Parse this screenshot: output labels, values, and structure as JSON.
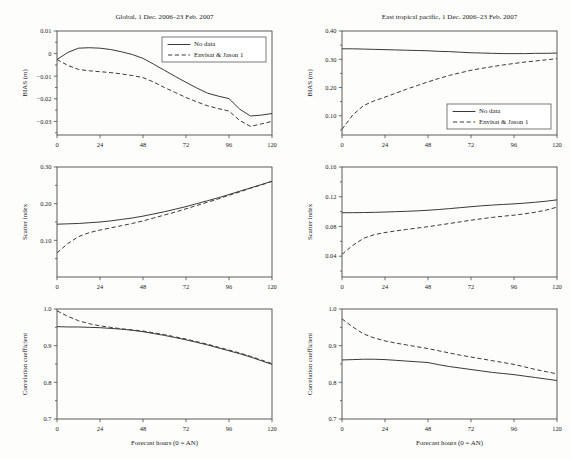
{
  "figure": {
    "name": "forecast-verification-multipanel",
    "width": 571,
    "height": 459,
    "background": "#fdfdfc",
    "line_color": "#3a3a3a",
    "axis_color": "#4a4a4a"
  },
  "legend": {
    "entries": [
      {
        "label": "No data",
        "style": "solid"
      },
      {
        "label": "Envisat & Jason 1",
        "style": "dashed"
      }
    ]
  },
  "axis_titles": {
    "x": "Forecast hours (0 = AN)",
    "bias": "BIAS (m)",
    "scatter": "Scatter index",
    "correlation": "Correlation coefficient"
  },
  "chart_data": [
    {
      "id": "global-bias",
      "type": "line",
      "title": "Global, 1 Dec. 2006–23 Feb. 2007",
      "xlabel": "",
      "ylabel": "BIAS (m)",
      "xlim": [
        0,
        120
      ],
      "ylim": [
        -0.036,
        0.01
      ],
      "xticks": [
        0,
        24,
        48,
        72,
        96,
        120
      ],
      "xticklabels": [
        "0",
        "24",
        "48",
        "72",
        "96",
        "120"
      ],
      "yticks": [
        0.01,
        0,
        -0.01,
        -0.02,
        -0.03
      ],
      "yticklabels": [
        "0.01",
        "0",
        "−0.01",
        "−0.02",
        "−0.03"
      ],
      "grid": false,
      "legend_position": "top-right",
      "x": [
        0,
        6,
        12,
        18,
        24,
        30,
        36,
        42,
        48,
        54,
        60,
        66,
        72,
        78,
        84,
        90,
        96,
        102,
        108,
        114,
        120
      ],
      "series": [
        {
          "name": "No data",
          "style": "solid",
          "values": [
            -0.0026,
            0.0005,
            0.0024,
            0.0026,
            0.0024,
            0.0018,
            0.0008,
            -0.0004,
            -0.0021,
            -0.0047,
            -0.0074,
            -0.0101,
            -0.0127,
            -0.0152,
            -0.0175,
            -0.0188,
            -0.0199,
            -0.0246,
            -0.0276,
            -0.0272,
            -0.0265
          ]
        },
        {
          "name": "Envisat & Jason 1",
          "style": "dashed",
          "values": [
            -0.0026,
            -0.0052,
            -0.007,
            -0.0076,
            -0.008,
            -0.0084,
            -0.009,
            -0.0097,
            -0.0106,
            -0.0126,
            -0.015,
            -0.0172,
            -0.0194,
            -0.0213,
            -0.0231,
            -0.0243,
            -0.0254,
            -0.0296,
            -0.0322,
            -0.0311,
            -0.03
          ]
        }
      ]
    },
    {
      "id": "etp-bias",
      "type": "line",
      "title": "East tropical pacific, 1 Dec. 2006–23 Feb. 2007",
      "xlabel": "",
      "ylabel": "BIAS (m)",
      "xlim": [
        0,
        120
      ],
      "ylim": [
        0.032,
        0.4
      ],
      "xticks": [
        0,
        24,
        48,
        72,
        96,
        120
      ],
      "xticklabels": [
        "0",
        "24",
        "48",
        "72",
        "96",
        "120"
      ],
      "yticks": [
        0.4,
        0.3,
        0.2,
        0.1
      ],
      "yticklabels": [
        "0.40",
        "0.30",
        "0.20",
        "0.10"
      ],
      "grid": false,
      "legend_position": "bottom-right",
      "x": [
        0,
        6,
        12,
        18,
        24,
        30,
        36,
        42,
        48,
        54,
        60,
        66,
        72,
        78,
        84,
        90,
        96,
        102,
        108,
        114,
        120
      ],
      "series": [
        {
          "name": "No data",
          "style": "solid",
          "values": [
            0.337,
            0.337,
            0.336,
            0.335,
            0.334,
            0.333,
            0.332,
            0.331,
            0.33,
            0.328,
            0.327,
            0.325,
            0.323,
            0.322,
            0.321,
            0.32,
            0.32,
            0.32,
            0.321,
            0.321,
            0.322
          ]
        },
        {
          "name": "Envisat & Jason 1",
          "style": "dashed",
          "values": [
            0.052,
            0.103,
            0.136,
            0.153,
            0.166,
            0.18,
            0.194,
            0.207,
            0.22,
            0.232,
            0.243,
            0.252,
            0.261,
            0.268,
            0.274,
            0.28,
            0.285,
            0.29,
            0.294,
            0.298,
            0.302
          ]
        }
      ]
    },
    {
      "id": "global-scatter",
      "type": "line",
      "title": "",
      "xlabel": "",
      "ylabel": "Scatter index",
      "xlim": [
        0,
        120
      ],
      "ylim": [
        0.0,
        0.3
      ],
      "xticks": [
        0,
        24,
        48,
        72,
        96,
        120
      ],
      "xticklabels": [
        "0",
        "24",
        "48",
        "72",
        "96",
        "120"
      ],
      "yticks": [
        0.3,
        0.2,
        0.1
      ],
      "yticklabels": [
        "0.30",
        "0.20",
        "0.10"
      ],
      "grid": false,
      "legend_position": "none",
      "x": [
        0,
        6,
        12,
        18,
        24,
        30,
        36,
        42,
        48,
        54,
        60,
        66,
        72,
        78,
        84,
        90,
        96,
        102,
        108,
        114,
        120
      ],
      "series": [
        {
          "name": "No data",
          "style": "solid",
          "values": [
            0.144,
            0.145,
            0.146,
            0.148,
            0.15,
            0.153,
            0.157,
            0.161,
            0.166,
            0.172,
            0.178,
            0.185,
            0.192,
            0.2,
            0.208,
            0.216,
            0.225,
            0.234,
            0.243,
            0.252,
            0.261
          ]
        },
        {
          "name": "Envisat & Jason 1",
          "style": "dashed",
          "values": [
            0.066,
            0.091,
            0.11,
            0.121,
            0.128,
            0.134,
            0.14,
            0.146,
            0.153,
            0.161,
            0.169,
            0.177,
            0.186,
            0.195,
            0.204,
            0.213,
            0.223,
            0.232,
            0.242,
            0.251,
            0.261
          ]
        }
      ]
    },
    {
      "id": "etp-scatter",
      "type": "line",
      "title": "",
      "xlabel": "",
      "ylabel": "Scatter index",
      "xlim": [
        0,
        120
      ],
      "ylim": [
        0.012,
        0.16
      ],
      "xticks": [
        0,
        24,
        48,
        72,
        96,
        120
      ],
      "xticklabels": [
        "0",
        "24",
        "48",
        "72",
        "96",
        "120"
      ],
      "yticks": [
        0.16,
        0.12,
        0.08,
        0.04
      ],
      "yticklabels": [
        "0.16",
        "0.12",
        "0.08",
        "0.04"
      ],
      "grid": false,
      "legend_position": "none",
      "x": [
        0,
        6,
        12,
        18,
        24,
        30,
        36,
        42,
        48,
        54,
        60,
        66,
        72,
        78,
        84,
        90,
        96,
        102,
        108,
        114,
        120
      ],
      "series": [
        {
          "name": "No data",
          "style": "solid",
          "values": [
            0.0985,
            0.0985,
            0.0987,
            0.099,
            0.0994,
            0.0999,
            0.1004,
            0.101,
            0.1018,
            0.1028,
            0.104,
            0.1053,
            0.1066,
            0.1078,
            0.1088,
            0.1096,
            0.1104,
            0.1114,
            0.1126,
            0.114,
            0.1158
          ]
        },
        {
          "name": "Envisat & Jason 1",
          "style": "dashed",
          "values": [
            0.0425,
            0.0545,
            0.064,
            0.069,
            0.0718,
            0.074,
            0.076,
            0.0778,
            0.0797,
            0.0818,
            0.084,
            0.0862,
            0.0884,
            0.0904,
            0.0922,
            0.0938,
            0.0952,
            0.097,
            0.0992,
            0.102,
            0.106
          ]
        }
      ]
    },
    {
      "id": "global-correlation",
      "type": "line",
      "title": "",
      "xlabel": "Forecast hours (0 = AN)",
      "ylabel": "Correlation coefficient",
      "xlim": [
        0,
        120
      ],
      "ylim": [
        0.7,
        1.0
      ],
      "xticks": [
        0,
        24,
        48,
        72,
        96,
        120
      ],
      "xticklabels": [
        "0",
        "24",
        "48",
        "72",
        "96",
        "120"
      ],
      "yticks": [
        1.0,
        0.9,
        0.8,
        0.7
      ],
      "yticklabels": [
        "1.0",
        "0.9",
        "0.8",
        "0.7"
      ],
      "grid": false,
      "legend_position": "none",
      "x": [
        0,
        6,
        12,
        18,
        24,
        30,
        36,
        42,
        48,
        54,
        60,
        66,
        72,
        78,
        84,
        90,
        96,
        102,
        108,
        114,
        120
      ],
      "series": [
        {
          "name": "No data",
          "style": "solid",
          "values": [
            0.952,
            0.951,
            0.951,
            0.95,
            0.949,
            0.947,
            0.945,
            0.942,
            0.938,
            0.933,
            0.928,
            0.922,
            0.916,
            0.909,
            0.902,
            0.894,
            0.886,
            0.878,
            0.869,
            0.859,
            0.849
          ]
        },
        {
          "name": "Envisat & Jason 1",
          "style": "dashed",
          "values": [
            0.995,
            0.98,
            0.968,
            0.96,
            0.954,
            0.95,
            0.946,
            0.943,
            0.94,
            0.935,
            0.93,
            0.924,
            0.918,
            0.911,
            0.904,
            0.896,
            0.888,
            0.88,
            0.871,
            0.861,
            0.851
          ]
        }
      ]
    },
    {
      "id": "etp-correlation",
      "type": "line",
      "title": "",
      "xlabel": "Forecast hours (0 = AN)",
      "ylabel": "Correlation coefficient",
      "xlim": [
        0,
        120
      ],
      "ylim": [
        0.7,
        1.0
      ],
      "xticks": [
        0,
        24,
        48,
        72,
        96,
        120
      ],
      "xticklabels": [
        "0",
        "24",
        "48",
        "72",
        "96",
        "120"
      ],
      "yticks": [
        1.0,
        0.9,
        0.8,
        0.7
      ],
      "yticklabels": [
        "1.0",
        "0.9",
        "0.8",
        "0.7"
      ],
      "grid": false,
      "legend_position": "none",
      "x": [
        0,
        6,
        12,
        18,
        24,
        30,
        36,
        42,
        48,
        54,
        60,
        66,
        72,
        78,
        84,
        90,
        96,
        102,
        108,
        114,
        120
      ],
      "series": [
        {
          "name": "No data",
          "style": "solid",
          "values": [
            0.861,
            0.862,
            0.863,
            0.863,
            0.862,
            0.86,
            0.858,
            0.856,
            0.854,
            0.848,
            0.843,
            0.839,
            0.835,
            0.831,
            0.827,
            0.824,
            0.821,
            0.817,
            0.813,
            0.809,
            0.805
          ]
        },
        {
          "name": "Envisat & Jason 1",
          "style": "dashed",
          "values": [
            0.973,
            0.951,
            0.932,
            0.921,
            0.913,
            0.907,
            0.902,
            0.897,
            0.892,
            0.886,
            0.88,
            0.874,
            0.869,
            0.864,
            0.859,
            0.854,
            0.849,
            0.842,
            0.835,
            0.829,
            0.823
          ]
        }
      ]
    }
  ],
  "panel_layout": [
    {
      "id": "global-bias",
      "name": "panel-global-bias",
      "left": 0,
      "top": 2,
      "width": 286,
      "height": 155
    },
    {
      "id": "etp-bias",
      "name": "panel-etp-bias",
      "left": 285,
      "top": 2,
      "width": 286,
      "height": 155
    },
    {
      "id": "global-scatter",
      "name": "panel-global-scatter",
      "left": 0,
      "top": 157,
      "width": 286,
      "height": 142
    },
    {
      "id": "etp-scatter",
      "name": "panel-etp-scatter",
      "left": 285,
      "top": 157,
      "width": 286,
      "height": 142
    },
    {
      "id": "global-correlation",
      "name": "panel-global-correlation",
      "left": 0,
      "top": 299,
      "width": 286,
      "height": 160
    },
    {
      "id": "etp-correlation",
      "name": "panel-etp-correlation",
      "left": 285,
      "top": 299,
      "width": 286,
      "height": 160
    }
  ]
}
